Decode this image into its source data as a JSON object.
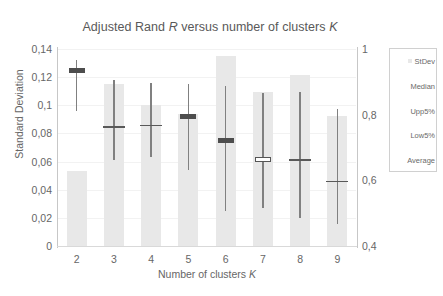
{
  "chart_data": {
    "type": "bar",
    "title": "Adjusted Rand R versus number of clusters K",
    "title_parts": {
      "a": "Adjusted Rand ",
      "italic1": "R",
      "b": " versus number of clusters ",
      "italic2": "K"
    },
    "xlabel": "Number of clusters K",
    "xlabel_parts": {
      "a": "Number of clusters ",
      "italic1": "K"
    },
    "ylabel": "Standard Deviation",
    "categories": [
      "2",
      "3",
      "4",
      "5",
      "6",
      "7",
      "8",
      "9"
    ],
    "ylim": [
      0,
      0.14
    ],
    "yticks": [
      "0",
      "0,02",
      "0,04",
      "0,06",
      "0,08",
      "0,1",
      "0,12",
      "0,14"
    ],
    "ytick_values": [
      0,
      0.02,
      0.04,
      0.06,
      0.08,
      0.1,
      0.12,
      0.14
    ],
    "y2lim": [
      0.4,
      1
    ],
    "y2ticks": [
      "0,4",
      "0,6",
      "0,8",
      "1"
    ],
    "y2tick_values": [
      0.4,
      0.6,
      0.8,
      1
    ],
    "grid": true,
    "legend_position": "right",
    "series": [
      {
        "name": "StDev",
        "axis": "left",
        "type": "bar",
        "values": [
          0.0532,
          0.1153,
          0.0999,
          0.0936,
          0.1352,
          0.1097,
          0.1212,
          0.0921
        ]
      },
      {
        "name": "Upp5%",
        "axis": "right",
        "type": "whisker-top",
        "values": [
          0.965,
          0.905,
          0.895,
          0.892,
          0.886,
          0.867,
          0.868,
          0.817
        ]
      },
      {
        "name": "Low5%",
        "axis": "right",
        "type": "whisker-bottom",
        "values": [
          0.812,
          0.662,
          0.672,
          0.632,
          0.508,
          0.517,
          0.484,
          0.467
        ]
      },
      {
        "name": "Median",
        "axis": "right",
        "type": "box",
        "values": [
          0.934,
          null,
          null,
          0.795,
          0.722,
          0.663,
          null,
          null
        ]
      },
      {
        "name": "Average",
        "axis": "right",
        "type": "tick",
        "values": [
          null,
          0.762,
          0.767,
          null,
          null,
          null,
          0.662,
          0.597
        ]
      }
    ],
    "legend_entries": [
      {
        "label": "StDev",
        "marker": "swatch",
        "color": "#e8e8e8"
      },
      {
        "label": "Median",
        "marker": "none",
        "color": "#4d4d4d"
      },
      {
        "label": "Upp5%",
        "marker": "none",
        "color": "#808080"
      },
      {
        "label": "Low5%",
        "marker": "none",
        "color": "#808080"
      },
      {
        "label": "Average",
        "marker": "none",
        "color": "#595959"
      }
    ]
  },
  "colors": {
    "bar": "#e8e8e8",
    "whisker": "#808080",
    "median": "#4d4d4d",
    "average": "#595959",
    "axis": "#c7c7c7",
    "grid": "#f2f2f2",
    "text": "#666666",
    "background": "#ffffff"
  }
}
